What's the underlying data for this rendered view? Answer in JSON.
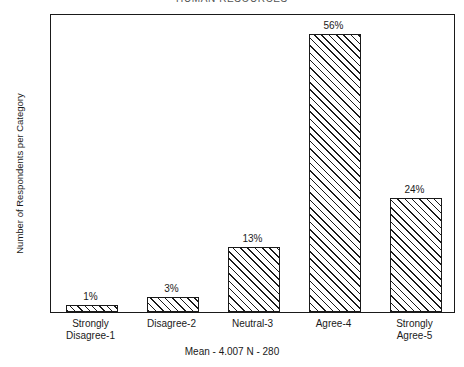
{
  "chart_data": {
    "type": "bar",
    "title": "HUMAN RESOURCES",
    "subtitle": "",
    "xlabel": "",
    "ylabel": "Number of Respondents per Category",
    "categories": [
      "Strongly\nDisagree-1",
      "Disagree-2",
      "Neutral-3",
      "Agree-4",
      "Strongly\nAgree-5"
    ],
    "values": [
      4,
      9,
      38,
      163,
      67
    ],
    "data_labels": [
      "1%",
      "3%",
      "13%",
      "56%",
      "24%"
    ],
    "percentages": [
      1,
      3,
      13,
      56,
      24
    ],
    "ylim": [
      0,
      175
    ],
    "ytick_values": [
      0,
      10,
      20,
      30,
      40,
      50,
      60,
      70,
      80,
      90,
      100,
      110,
      120,
      130,
      140,
      150,
      160,
      170
    ],
    "ytick_labels": [
      "0",
      "10",
      "20",
      "30",
      "40",
      "50",
      "60",
      "70",
      "80",
      "90",
      "100",
      "110",
      "120",
      "130",
      "140",
      "150",
      "160",
      "170"
    ],
    "grid": false,
    "legend": "none",
    "bar_fill": "diagonal-hatch",
    "bar_edge_color": "#1a1a1a",
    "footer": "Mean - 4.007  N - 280",
    "mean": "4.007",
    "n": "280"
  },
  "footer": {
    "text": "Mean - 4.007  N - 280"
  }
}
